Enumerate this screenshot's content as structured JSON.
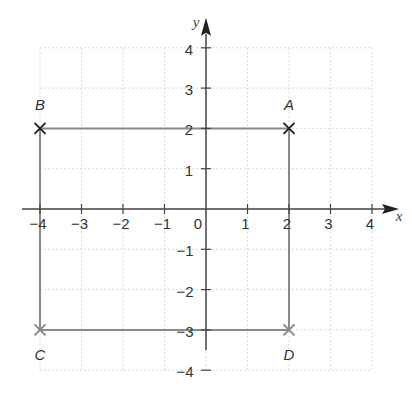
{
  "chart_data": {
    "type": "scatter",
    "title": "",
    "xlabel": "x",
    "ylabel": "y",
    "xlim": [
      -4,
      4
    ],
    "ylim": [
      -4,
      4
    ],
    "grid": true,
    "x_ticks": [
      "−4",
      "−3",
      "−2",
      "−1",
      "0",
      "1",
      "2",
      "3",
      "4"
    ],
    "y_ticks": [
      "4",
      "3",
      "2",
      "1",
      "−1",
      "−2",
      "−3",
      "−4"
    ],
    "points": [
      {
        "label": "A",
        "x": 2,
        "y": 2,
        "marker": "x",
        "color": "#222222"
      },
      {
        "label": "B",
        "x": -4,
        "y": 2,
        "marker": "x",
        "color": "#222222"
      },
      {
        "label": "C",
        "x": -4,
        "y": -3,
        "marker": "x",
        "color": "#888888"
      },
      {
        "label": "D",
        "x": 2,
        "y": -3,
        "marker": "x",
        "color": "#888888"
      }
    ],
    "segments": [
      [
        "A",
        "B"
      ],
      [
        "B",
        "C"
      ],
      [
        "C",
        "D"
      ],
      [
        "D",
        "A"
      ]
    ],
    "shape": "rectangle ABCD"
  },
  "colors": {
    "axis": "#444444",
    "grid": "#d9d9d9",
    "rect": "#8a8a8a"
  }
}
